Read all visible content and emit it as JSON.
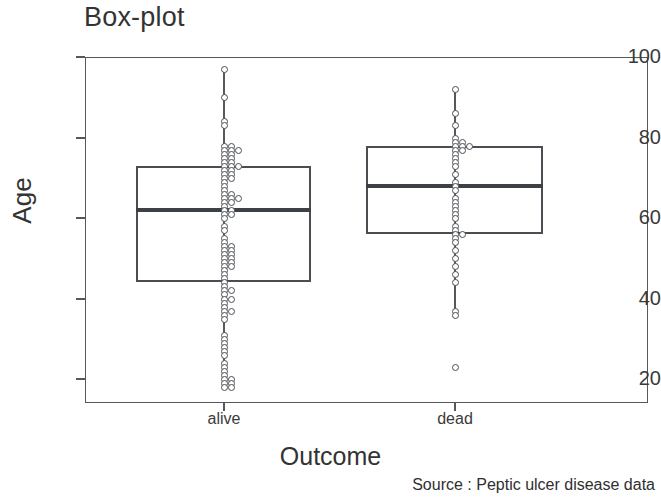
{
  "chart_data": {
    "type": "box",
    "title": "Box-plot",
    "xlabel": "Outcome",
    "ylabel": "Age",
    "source_note": "Source : Peptic ulcer disease data",
    "categories": [
      "alive",
      "dead"
    ],
    "ylim": [
      14,
      100
    ],
    "yticks": [
      100,
      80,
      60,
      40,
      20
    ],
    "ytick_labels": [
      "100",
      "80",
      "60",
      "40",
      "20"
    ],
    "grid": false,
    "legend": "none",
    "overlay": "stripchart of individual observations",
    "boxes": [
      {
        "name": "alive",
        "q1": 44,
        "median": 62,
        "q3": 73,
        "whisker_low": 18,
        "whisker_high": 97,
        "outliers": []
      },
      {
        "name": "dead",
        "q1": 56,
        "median": 68,
        "q3": 78,
        "whisker_low": 36,
        "whisker_high": 92,
        "outliers": [
          23
        ]
      }
    ],
    "points": {
      "alive": [
        97,
        90,
        84,
        83,
        78,
        78,
        77,
        77,
        77,
        76,
        76,
        75,
        75,
        74,
        74,
        73,
        73,
        73,
        72,
        72,
        71,
        71,
        70,
        70,
        69,
        68,
        67,
        66,
        66,
        65,
        65,
        65,
        64,
        64,
        63,
        62,
        62,
        61,
        61,
        60,
        58,
        57,
        55,
        54,
        53,
        53,
        52,
        52,
        51,
        51,
        50,
        50,
        49,
        49,
        48,
        48,
        47,
        46,
        45,
        44,
        43,
        42,
        42,
        41,
        40,
        40,
        39,
        38,
        37,
        37,
        36,
        35,
        31,
        30,
        29,
        28,
        27,
        26,
        24,
        23,
        22,
        21,
        20,
        20,
        19,
        19,
        18,
        18
      ],
      "dead": [
        92,
        86,
        83,
        80,
        79,
        79,
        78,
        78,
        78,
        77,
        77,
        76,
        75,
        74,
        73,
        71,
        69,
        68,
        67,
        65,
        64,
        63,
        62,
        61,
        60,
        58,
        57,
        56,
        56,
        55,
        54,
        52,
        50,
        48,
        46,
        44,
        37,
        36,
        23
      ]
    }
  }
}
